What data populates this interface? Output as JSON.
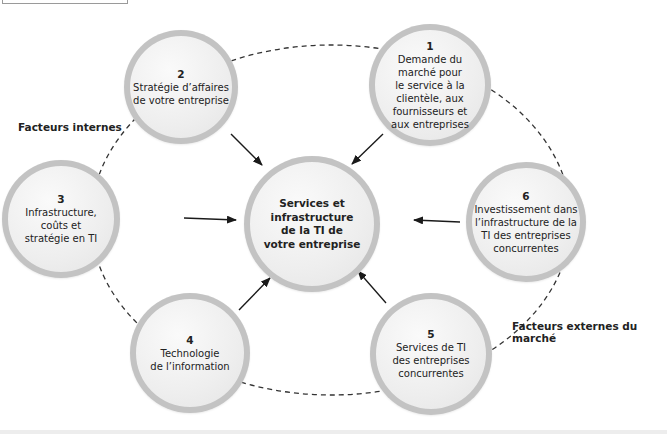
{
  "diagram": {
    "center": {
      "text": "Services et\ninfrastructure\nde la TI de\nvotre entreprise"
    },
    "nodes": [
      {
        "number": "1",
        "text": "Demande du\nmarché pour\nle service à la\nclientèle, aux\nfournisseurs et\naux entreprises"
      },
      {
        "number": "2",
        "text": "Stratégie d’affaires\nde votre entreprise"
      },
      {
        "number": "3",
        "text": "Infrastructure,\ncoûts et\nstratégie en TI"
      },
      {
        "number": "4",
        "text": "Technologie\nde l’information"
      },
      {
        "number": "5",
        "text": "Services de TI\ndes entreprises\nconcurrentes"
      },
      {
        "number": "6",
        "text": "Investissement dans\nl’infrastructure de la\nTI des entreprises\nconcurrentes"
      }
    ],
    "labels": {
      "internal": "Facteurs internes",
      "external": "Facteurs externes du marché"
    },
    "colors": {
      "circle_fill": "#eeeeee",
      "circle_ring": "#c3c3c3",
      "arrow": "#1a1a1a",
      "dashed_ring": "#333333"
    }
  }
}
